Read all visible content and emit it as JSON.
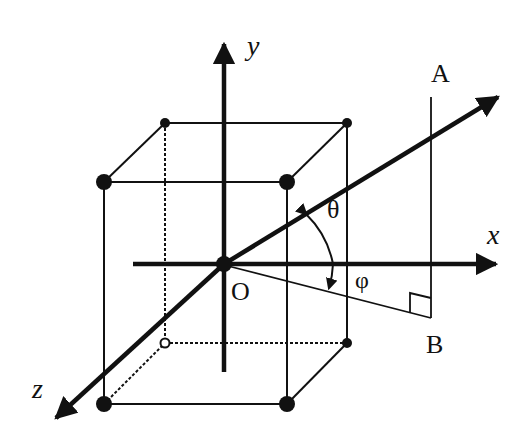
{
  "diagram": {
    "colors": {
      "stroke": "#111111",
      "background": "#ffffff"
    },
    "axes": {
      "x": {
        "label": "x"
      },
      "y": {
        "label": "y"
      },
      "z": {
        "label": "z"
      }
    },
    "points": {
      "origin": {
        "label": "O"
      },
      "A": {
        "label": "A"
      },
      "B": {
        "label": "B"
      }
    },
    "angles": {
      "theta": {
        "label": "θ"
      },
      "phi": {
        "label": "φ"
      }
    },
    "cube": {
      "front_corners": 4,
      "back_corners": 4,
      "hidden_edges": "dotted"
    }
  }
}
